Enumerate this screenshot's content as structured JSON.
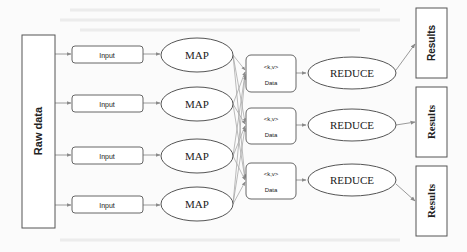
{
  "diagram": {
    "type": "mapreduce-flow",
    "raw_data": {
      "label": "Raw data"
    },
    "inputs": [
      {
        "label": "Input"
      },
      {
        "label": "Input"
      },
      {
        "label": "Input"
      },
      {
        "label": "Input"
      }
    ],
    "maps": [
      {
        "label": "MAP"
      },
      {
        "label": "MAP"
      },
      {
        "label": "MAP"
      },
      {
        "label": "MAP"
      }
    ],
    "data_nodes": [
      {
        "kv": "<k,v>",
        "label": "Data"
      },
      {
        "kv": "<k,v>",
        "label": "Data"
      },
      {
        "kv": "<k,v>",
        "label": "Data"
      }
    ],
    "reduces": [
      {
        "label": "REDUCE"
      },
      {
        "label": "REDUCE"
      },
      {
        "label": "REDUCE"
      }
    ],
    "results": [
      {
        "label": "Results"
      },
      {
        "label": "Results"
      },
      {
        "label": "Results"
      }
    ],
    "edges": {
      "raw_to_input": "1-to-each",
      "input_to_map": "1-to-1",
      "map_to_data": "all-to-all",
      "data_to_reduce": "1-to-1",
      "reduce_to_results": "1-to-1"
    },
    "colors": {
      "stroke": "#555555",
      "edge": "#9a9a9a",
      "text": "#222222",
      "background": "#fbfbfb"
    }
  }
}
